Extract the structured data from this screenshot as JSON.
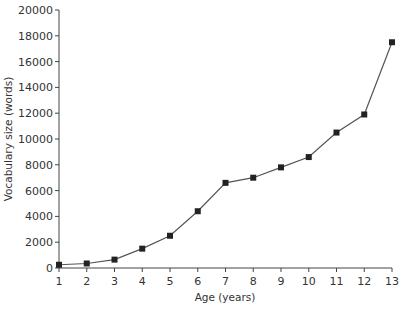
{
  "chart_data": {
    "type": "line",
    "title": "",
    "xlabel": "Age (years)",
    "ylabel": "Vocabulary size (words)",
    "x": [
      1,
      2,
      3,
      4,
      5,
      6,
      7,
      8,
      9,
      10,
      11,
      12,
      13
    ],
    "series": [
      {
        "name": "Vocabulary size",
        "values": [
          250,
          350,
          650,
          1500,
          2500,
          4400,
          6600,
          7000,
          7800,
          8600,
          10500,
          11900,
          17500
        ],
        "marker": "square",
        "color": "#222222"
      }
    ],
    "xlim": [
      1,
      13
    ],
    "ylim": [
      0,
      20000
    ],
    "xticks": [
      "1",
      "2",
      "3",
      "4",
      "5",
      "6",
      "7",
      "8",
      "9",
      "10",
      "11",
      "12",
      "13"
    ],
    "yticks": [
      "0",
      "2000",
      "4000",
      "6000",
      "8000",
      "10000",
      "12000",
      "14000",
      "16000",
      "18000",
      "20000"
    ],
    "grid": false,
    "legend": null
  }
}
